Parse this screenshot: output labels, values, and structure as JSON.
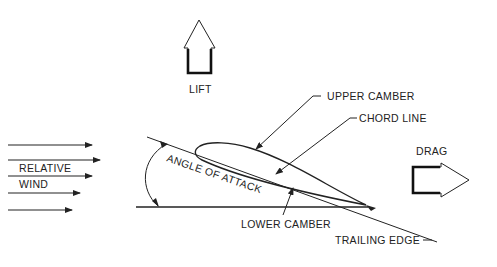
{
  "diagram": {
    "labels": {
      "lift": "LIFT",
      "drag": "DRAG",
      "relative": "RELATIVE",
      "wind": "WIND",
      "upper_camber": "UPPER CAMBER",
      "chord_line": "CHORD LINE",
      "angle_of_attack": "ANGLE OF ATTACK",
      "lower_camber": "LOWER CAMBER",
      "trailing_edge": "TRAILING EDGE"
    },
    "colors": {
      "ink": "#222222",
      "background": "#ffffff"
    }
  }
}
